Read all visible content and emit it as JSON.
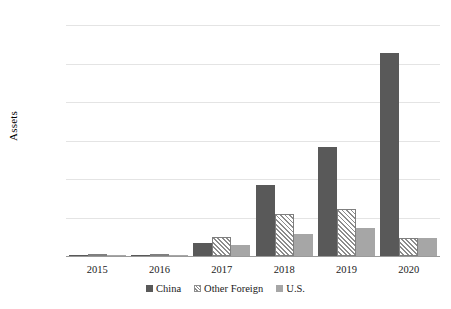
{
  "chart_data": {
    "type": "bar",
    "title": "",
    "xlabel": "",
    "ylabel": "Assets",
    "ylim": [
      0,
      300
    ],
    "ytick_step": 50,
    "yticks": [
      0,
      50,
      100,
      150,
      200,
      250,
      300
    ],
    "ytick_labels": [
      "0",
      "50",
      "100",
      "150",
      "200",
      "250",
      "300"
    ],
    "categories": [
      "2015",
      "2016",
      "2017",
      "2018",
      "2019",
      "2020"
    ],
    "grid": "horizontal",
    "legend_position": "bottom",
    "series": [
      {
        "name": "China",
        "color": "#595959",
        "fill": "solid",
        "values": [
          1,
          1,
          17,
          92,
          142,
          264
        ]
      },
      {
        "name": "Other Foreign",
        "color": "#ffffff",
        "fill": "diagonal-hatch",
        "values": [
          1,
          3,
          25,
          54,
          61,
          24
        ]
      },
      {
        "name": "U.S.",
        "color": "#a6a6a6",
        "fill": "solid",
        "values": [
          1,
          1,
          14,
          29,
          36,
          23
        ]
      }
    ]
  },
  "legend": {
    "items": [
      {
        "label": "China",
        "swatch": "china"
      },
      {
        "label": "Other Foreign",
        "swatch": "other"
      },
      {
        "label": "U.S.",
        "swatch": "us"
      }
    ]
  }
}
